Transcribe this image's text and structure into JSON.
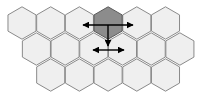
{
  "diagram": {
    "type": "hexagonal-grid",
    "orientation": "pointy-top",
    "hex_size": 16.2,
    "colors": {
      "background": "#ffffff",
      "cell_fill": "#efefef",
      "cell_stroke": "#8a8a8a",
      "highlight_fill": "#8c8c8c",
      "highlight_stroke": "#5a5a5a",
      "arrow": "#000000"
    },
    "rows": [
      {
        "y": 23,
        "x_centers": [
          22,
          50.7,
          79.4,
          108.1,
          136.8,
          165.5
        ]
      },
      {
        "y": 49,
        "x_centers": [
          36.4,
          65.1,
          93.8,
          122.5,
          151.2,
          179.9
        ]
      },
      {
        "y": 75,
        "x_centers": [
          50.7,
          79.4,
          108.1,
          136.8,
          165.5
        ]
      }
    ],
    "highlighted_cell": {
      "row": 0,
      "col": 3
    },
    "arrows": [
      {
        "name": "horizontal-arrow-top",
        "x1": 83,
        "y1": 25,
        "x2": 133,
        "y2": 25,
        "heads": "both"
      },
      {
        "name": "vertical-arrow-down",
        "x1": 108,
        "y1": 25,
        "x2": 108,
        "y2": 46,
        "heads": "end"
      },
      {
        "name": "horizontal-arrow-bottom",
        "x1": 93,
        "y1": 50,
        "x2": 124,
        "y2": 50,
        "heads": "both"
      }
    ]
  }
}
